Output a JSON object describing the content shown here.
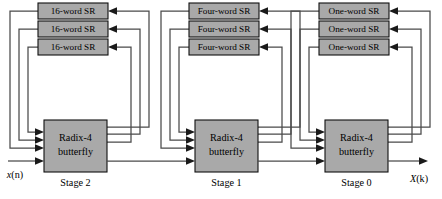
{
  "figure": {
    "type": "block-diagram",
    "width": 442,
    "height": 199,
    "colors": {
      "block_fill": "#a9a9a9",
      "block_stroke": "#101010",
      "wire": "#4a4a4a",
      "arrow": "#1a1a1a",
      "background": "#ffffff",
      "text": "#000000"
    }
  },
  "io": {
    "input_label": "x(n)",
    "input_var": "x",
    "input_index": "(n)",
    "output_label": "X(k)",
    "output_var": "X",
    "output_index": "(k)"
  },
  "stages": [
    {
      "id": "stage-2",
      "stage_label": "Stage 2",
      "butterfly_label_line1": "Radix-4",
      "butterfly_label_line2": "butterfly",
      "shift_registers": [
        {
          "label": "16-word SR"
        },
        {
          "label": "16-word SR"
        },
        {
          "label": "16-word SR"
        }
      ]
    },
    {
      "id": "stage-1",
      "stage_label": "Stage 1",
      "butterfly_label_line1": "Radix-4",
      "butterfly_label_line2": "butterfly",
      "shift_registers": [
        {
          "label": "Four-word SR"
        },
        {
          "label": "Four-word SR"
        },
        {
          "label": "Four-word SR"
        }
      ]
    },
    {
      "id": "stage-0",
      "stage_label": "Stage 0",
      "butterfly_label_line1": "Radix-4",
      "butterfly_label_line2": "butterfly",
      "shift_registers": [
        {
          "label": "One-word SR"
        },
        {
          "label": "One-word SR"
        },
        {
          "label": "One-word SR"
        }
      ]
    }
  ]
}
